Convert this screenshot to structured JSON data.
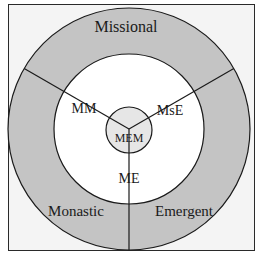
{
  "diagram": {
    "type": "concentric-circles-venn",
    "outer_ring_segments": [
      {
        "id": "missional",
        "label": "Missional"
      },
      {
        "id": "monastic",
        "label": "Monastic"
      },
      {
        "id": "emergent",
        "label": "Emergent"
      }
    ],
    "inner_ring_segments": [
      {
        "id": "mm",
        "label": "MM"
      },
      {
        "id": "mse",
        "label": "MsE"
      },
      {
        "id": "me",
        "label": "ME"
      }
    ],
    "center": {
      "id": "mem",
      "label": "MEM"
    },
    "colors": {
      "outer_ring": "#c4c4c4",
      "inner_ring": "#ffffff",
      "center": "#e6e6e6",
      "stroke": "#1a1a1a",
      "background": "#f4f4f4"
    }
  }
}
